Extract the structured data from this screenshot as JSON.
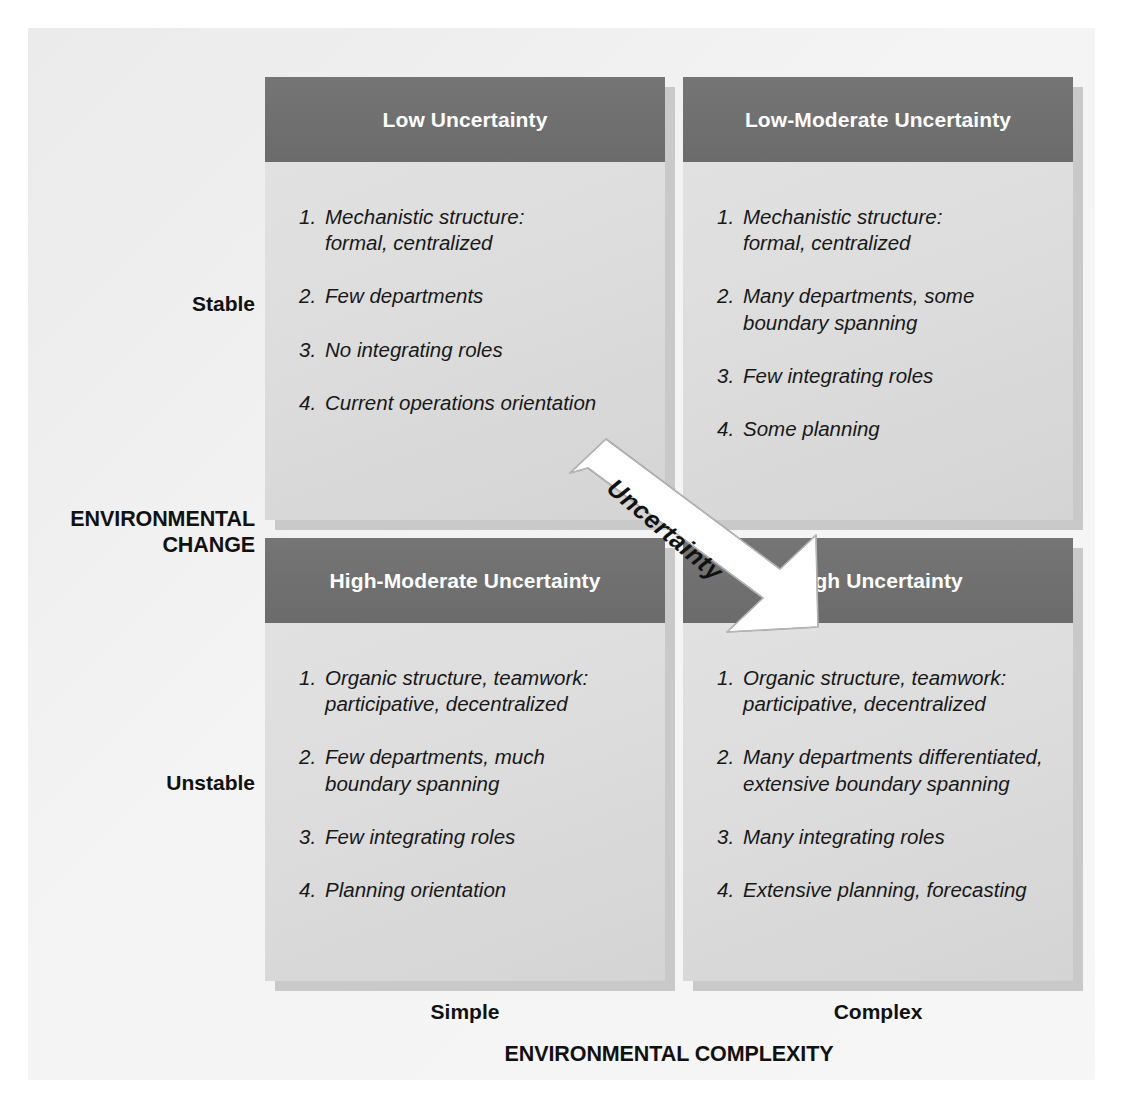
{
  "diagram": {
    "arrow_label": "Uncertainty",
    "axes": {
      "y_axis_title": "ENVIRONMENTAL\nCHANGE",
      "y_axis_high": "Stable",
      "y_axis_low": "Unstable",
      "x_axis_title": "ENVIRONMENTAL COMPLEXITY",
      "x_axis_left": "Simple",
      "x_axis_right": "Complex"
    },
    "colors": {
      "header_bar": "#6e6e6e",
      "panel_body": "#dcdcdc",
      "panel_shadow": "#c9c9c9",
      "page_background": "#f1f1f1",
      "header_text": "#ffffff",
      "body_text": "#181818"
    },
    "quadrants": [
      {
        "position": "top-left",
        "title": "Low Uncertainty",
        "items": [
          {
            "num": "1.",
            "text": "Mechanistic structure:\nformal, centralized"
          },
          {
            "num": "2.",
            "text": "Few departments"
          },
          {
            "num": "3.",
            "text": "No integrating roles"
          },
          {
            "num": "4.",
            "text": "Current operations orientation"
          }
        ]
      },
      {
        "position": "top-right",
        "title": "Low-Moderate Uncertainty",
        "items": [
          {
            "num": "1.",
            "text": "Mechanistic structure:\nformal, centralized"
          },
          {
            "num": "2.",
            "text": "Many departments, some\nboundary spanning"
          },
          {
            "num": "3.",
            "text": "Few integrating roles"
          },
          {
            "num": "4.",
            "text": "Some planning"
          }
        ]
      },
      {
        "position": "bottom-left",
        "title": "High-Moderate Uncertainty",
        "items": [
          {
            "num": "1.",
            "text": "Organic structure, teamwork:\nparticipative, decentralized"
          },
          {
            "num": "2.",
            "text": "Few departments, much\nboundary spanning"
          },
          {
            "num": "3.",
            "text": "Few integrating roles"
          },
          {
            "num": "4.",
            "text": "Planning orientation"
          }
        ]
      },
      {
        "position": "bottom-right",
        "title": "High Uncertainty",
        "items": [
          {
            "num": "1.",
            "text": "Organic structure, teamwork:\nparticipative, decentralized"
          },
          {
            "num": "2.",
            "text": "Many departments differentiated,\nextensive boundary spanning"
          },
          {
            "num": "3.",
            "text": "Many integrating roles"
          },
          {
            "num": "4.",
            "text": "Extensive planning, forecasting"
          }
        ]
      }
    ]
  }
}
